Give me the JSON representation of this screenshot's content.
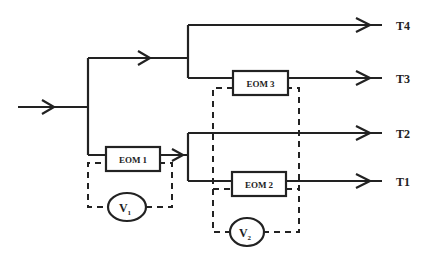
{
  "diagram": {
    "type": "optical switch tree",
    "input_label": "",
    "outputs": [
      {
        "id": "T4",
        "label": "T4"
      },
      {
        "id": "T3",
        "label": "T3"
      },
      {
        "id": "T2",
        "label": "T2"
      },
      {
        "id": "T1",
        "label": "T1"
      }
    ],
    "modulators": [
      {
        "id": "eom1",
        "label": "EOM 1"
      },
      {
        "id": "eom2",
        "label": "EOM 2"
      },
      {
        "id": "eom3",
        "label": "EOM 3"
      }
    ],
    "voltage_sources": [
      {
        "id": "v1",
        "label": "V",
        "subscript": "1",
        "drives": [
          "EOM 1"
        ]
      },
      {
        "id": "v2",
        "label": "V",
        "subscript": "2",
        "drives": [
          "EOM 2",
          "EOM 3"
        ]
      }
    ],
    "colors": {
      "line": "#222222",
      "background": "#ffffff"
    }
  }
}
